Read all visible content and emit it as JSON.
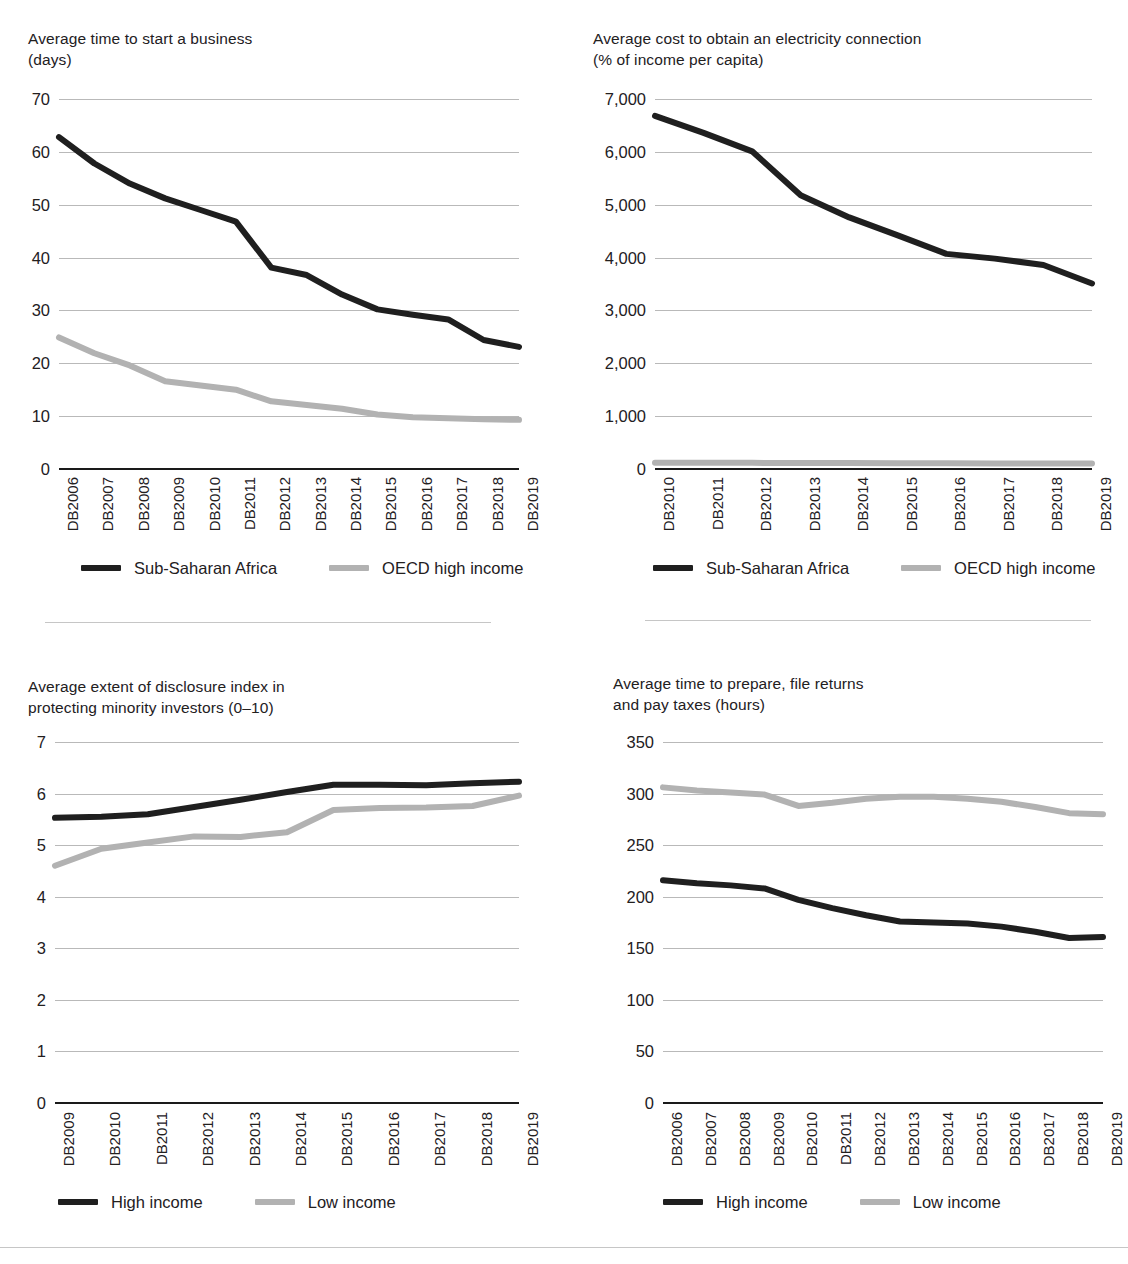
{
  "colors": {
    "dark_series": "#1f1f1f",
    "light_series": "#b2b2b2",
    "gridline": "#b9b9b9",
    "axis": "#1a1a1a",
    "text": "#23201e",
    "divider": "#c6c6c6"
  },
  "panels": [
    {
      "id": "start-a-business",
      "title": "Average time to start a business\n(days)"
    },
    {
      "id": "electricity-connection-cost",
      "title": "Average cost to obtain an electricity connection\n(% of income per capita)"
    },
    {
      "id": "disclosure-index",
      "title": "Average extent of disclosure index in\nprotecting minority investors (0–10)"
    },
    {
      "id": "time-to-pay-taxes",
      "title": "Average time to prepare, file returns\nand pay taxes (hours)"
    }
  ],
  "chart_data": [
    {
      "id": "start-a-business",
      "type": "line",
      "title": "Average time to start a business (days)",
      "xlabel": "",
      "ylabel": "days",
      "categories": [
        "DB2006",
        "DB2007",
        "DB2008",
        "DB2009",
        "DB2010",
        "DB2011",
        "DB2012",
        "DB2013",
        "DB2014",
        "DB2015",
        "DB2016",
        "DB2017",
        "DB2018",
        "DB2019"
      ],
      "yticks": [
        "0",
        "10",
        "20",
        "30",
        "40",
        "50",
        "60",
        "70"
      ],
      "ylim": [
        0,
        70
      ],
      "grid": true,
      "legend_position": "bottom",
      "series": [
        {
          "name": "Sub-Saharan Africa",
          "color": "#1f1f1f",
          "values": [
            62.8,
            57.8,
            54.0,
            51.2,
            49.0,
            46.8,
            38.1,
            36.7,
            33.0,
            30.2,
            29.2,
            28.3,
            24.4,
            23.1
          ]
        },
        {
          "name": "OECD high income",
          "color": "#b2b2b2",
          "values": [
            24.9,
            21.9,
            19.6,
            16.6,
            15.8,
            15.0,
            12.8,
            12.1,
            11.4,
            10.3,
            9.8,
            9.6,
            9.4,
            9.3
          ]
        }
      ]
    },
    {
      "id": "electricity-connection-cost",
      "type": "line",
      "title": "Average cost to obtain an electricity connection (% of income per capita)",
      "xlabel": "",
      "ylabel": "% of income per capita",
      "categories": [
        "DB2010",
        "DB2011",
        "DB2012",
        "DB2013",
        "DB2014",
        "DB2015",
        "DB2016",
        "DB2017",
        "DB2018",
        "DB2019"
      ],
      "yticks": [
        "0",
        "1,000",
        "2,000",
        "3,000",
        "4,000",
        "5,000",
        "6,000",
        "7,000"
      ],
      "ylim": [
        0,
        7000
      ],
      "grid": true,
      "legend_position": "bottom",
      "series": [
        {
          "name": "Sub-Saharan Africa",
          "color": "#1f1f1f",
          "values": [
            6680,
            6360,
            6010,
            5180,
            4760,
            4420,
            4070,
            3980,
            3860,
            3510
          ]
        },
        {
          "name": "OECD high income",
          "color": "#b2b2b2",
          "values": [
            120,
            118,
            116,
            114,
            112,
            110,
            108,
            106,
            104,
            102
          ]
        }
      ]
    },
    {
      "id": "disclosure-index",
      "type": "line",
      "title": "Average extent of disclosure index in protecting minority investors (0–10)",
      "xlabel": "",
      "ylabel": "index (0–10)",
      "categories": [
        "DB2009",
        "DB2010",
        "DB2011",
        "DB2012",
        "DB2013",
        "DB2014",
        "DB2015",
        "DB2016",
        "DB2017",
        "DB2018",
        "DB2019"
      ],
      "yticks": [
        "0",
        "1",
        "2",
        "3",
        "4",
        "5",
        "6",
        "7"
      ],
      "ylim": [
        0,
        7
      ],
      "grid": true,
      "legend_position": "bottom",
      "series": [
        {
          "name": "High income",
          "color": "#1f1f1f",
          "values": [
            5.53,
            5.55,
            5.6,
            5.74,
            5.88,
            6.03,
            6.17,
            6.17,
            6.16,
            6.2,
            6.23
          ]
        },
        {
          "name": "Low income",
          "color": "#b2b2b2",
          "values": [
            4.6,
            4.93,
            5.05,
            5.17,
            5.16,
            5.25,
            5.68,
            5.72,
            5.73,
            5.76,
            5.96
          ]
        }
      ]
    },
    {
      "id": "time-to-pay-taxes",
      "type": "line",
      "title": "Average time to prepare, file returns and pay taxes (hours)",
      "xlabel": "",
      "ylabel": "hours",
      "categories": [
        "DB2006",
        "DB2007",
        "DB2008",
        "DB2009",
        "DB2010",
        "DB2011",
        "DB2012",
        "DB2013",
        "DB2014",
        "DB2015",
        "DB2016",
        "DB2017",
        "DB2018",
        "DB2019"
      ],
      "yticks": [
        "0",
        "50",
        "100",
        "150",
        "200",
        "250",
        "300",
        "350"
      ],
      "ylim": [
        0,
        350
      ],
      "grid": true,
      "legend_position": "bottom",
      "series": [
        {
          "name": "High income",
          "color": "#1f1f1f",
          "values": [
            216,
            213,
            211,
            208,
            197,
            189,
            182,
            176,
            175,
            174,
            171,
            166,
            160,
            161
          ]
        },
        {
          "name": "Low income",
          "color": "#b2b2b2",
          "values": [
            306,
            303,
            301,
            299,
            288,
            291,
            295,
            297,
            297,
            295,
            292,
            287,
            281,
            280
          ]
        }
      ]
    }
  ]
}
